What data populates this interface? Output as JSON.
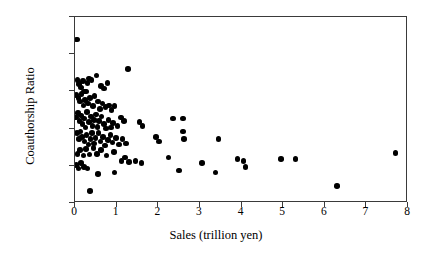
{
  "chart_data": {
    "type": "scatter",
    "title": "",
    "xlabel": "Sales (trillion yen)",
    "ylabel": "Coauthorship Ratio",
    "xlim": [
      0,
      8
    ],
    "ylim": [
      0,
      1
    ],
    "grid": false,
    "legend": null,
    "xticks": [
      0,
      1,
      2,
      3,
      4,
      5,
      6,
      7,
      8
    ],
    "xtick_labels": [
      "0",
      "1",
      "2",
      "3",
      "4",
      "5",
      "6",
      "7",
      "8"
    ],
    "yticks": [
      0,
      0.2,
      0.4,
      0.6,
      0.8,
      1.0
    ],
    "ytick_labels": [
      "0%",
      "20%",
      "40%",
      "60%",
      "80%",
      "100%"
    ],
    "marker": "filled-circle",
    "marker_color": "#000000",
    "series": [
      {
        "name": "firms",
        "points": [
          [
            0.05,
            0.88
          ],
          [
            0.06,
            0.66
          ],
          [
            0.1,
            0.64
          ],
          [
            0.14,
            0.62
          ],
          [
            0.19,
            0.655
          ],
          [
            0.22,
            0.6
          ],
          [
            0.3,
            0.645
          ],
          [
            0.33,
            0.67
          ],
          [
            0.4,
            0.66
          ],
          [
            0.52,
            0.685
          ],
          [
            0.62,
            0.63
          ],
          [
            0.7,
            0.615
          ],
          [
            0.78,
            0.645
          ],
          [
            1.28,
            0.72
          ],
          [
            0.04,
            0.58
          ],
          [
            0.08,
            0.565
          ],
          [
            0.12,
            0.545
          ],
          [
            0.16,
            0.585
          ],
          [
            0.2,
            0.525
          ],
          [
            0.24,
            0.555
          ],
          [
            0.27,
            0.6
          ],
          [
            0.31,
            0.535
          ],
          [
            0.36,
            0.565
          ],
          [
            0.43,
            0.52
          ],
          [
            0.47,
            0.575
          ],
          [
            0.55,
            0.545
          ],
          [
            0.6,
            0.505
          ],
          [
            0.66,
            0.535
          ],
          [
            0.73,
            0.515
          ],
          [
            0.82,
            0.525
          ],
          [
            0.88,
            0.5
          ],
          [
            0.95,
            0.52
          ],
          [
            0.03,
            0.46
          ],
          [
            0.07,
            0.485
          ],
          [
            0.11,
            0.44
          ],
          [
            0.15,
            0.47
          ],
          [
            0.18,
            0.425
          ],
          [
            0.21,
            0.455
          ],
          [
            0.25,
            0.405
          ],
          [
            0.29,
            0.49
          ],
          [
            0.34,
            0.435
          ],
          [
            0.38,
            0.465
          ],
          [
            0.42,
            0.415
          ],
          [
            0.46,
            0.445
          ],
          [
            0.5,
            0.475
          ],
          [
            0.54,
            0.41
          ],
          [
            0.58,
            0.44
          ],
          [
            0.64,
            0.465
          ],
          [
            0.69,
            0.425
          ],
          [
            0.75,
            0.4
          ],
          [
            0.8,
            0.445
          ],
          [
            0.86,
            0.405
          ],
          [
            0.92,
            0.43
          ],
          [
            1.02,
            0.415
          ],
          [
            1.1,
            0.46
          ],
          [
            1.18,
            0.44
          ],
          [
            1.55,
            0.435
          ],
          [
            1.62,
            0.415
          ],
          [
            2.35,
            0.455
          ],
          [
            2.6,
            0.455
          ],
          [
            0.05,
            0.375
          ],
          [
            0.09,
            0.345
          ],
          [
            0.13,
            0.385
          ],
          [
            0.17,
            0.355
          ],
          [
            0.23,
            0.33
          ],
          [
            0.28,
            0.365
          ],
          [
            0.32,
            0.315
          ],
          [
            0.37,
            0.345
          ],
          [
            0.41,
            0.375
          ],
          [
            0.45,
            0.32
          ],
          [
            0.49,
            0.35
          ],
          [
            0.56,
            0.375
          ],
          [
            0.61,
            0.33
          ],
          [
            0.67,
            0.355
          ],
          [
            0.72,
            0.31
          ],
          [
            0.79,
            0.34
          ],
          [
            0.85,
            0.365
          ],
          [
            0.9,
            0.325
          ],
          [
            0.98,
            0.35
          ],
          [
            1.06,
            0.315
          ],
          [
            1.14,
            0.345
          ],
          [
            1.22,
            0.32
          ],
          [
            1.95,
            0.355
          ],
          [
            2.02,
            0.33
          ],
          [
            2.6,
            0.385
          ],
          [
            2.62,
            0.345
          ],
          [
            3.45,
            0.345
          ],
          [
            0.06,
            0.265
          ],
          [
            0.12,
            0.285
          ],
          [
            0.2,
            0.255
          ],
          [
            0.26,
            0.29
          ],
          [
            0.35,
            0.26
          ],
          [
            0.44,
            0.295
          ],
          [
            0.53,
            0.265
          ],
          [
            0.63,
            0.285
          ],
          [
            0.76,
            0.255
          ],
          [
            0.94,
            0.275
          ],
          [
            1.12,
            0.225
          ],
          [
            1.2,
            0.245
          ],
          [
            1.3,
            0.22
          ],
          [
            1.45,
            0.225
          ],
          [
            1.6,
            0.215
          ],
          [
            2.25,
            0.245
          ],
          [
            3.05,
            0.215
          ],
          [
            3.9,
            0.235
          ],
          [
            4.05,
            0.225
          ],
          [
            4.1,
            0.195
          ],
          [
            4.95,
            0.235
          ],
          [
            5.3,
            0.235
          ],
          [
            7.7,
            0.27
          ],
          [
            0.04,
            0.205
          ],
          [
            0.08,
            0.185
          ],
          [
            0.15,
            0.215
          ],
          [
            0.22,
            0.195
          ],
          [
            0.3,
            0.185
          ],
          [
            0.55,
            0.155
          ],
          [
            0.95,
            0.165
          ],
          [
            2.5,
            0.175
          ],
          [
            3.38,
            0.165
          ],
          [
            0.36,
            0.065
          ],
          [
            6.3,
            0.09
          ]
        ]
      }
    ]
  }
}
